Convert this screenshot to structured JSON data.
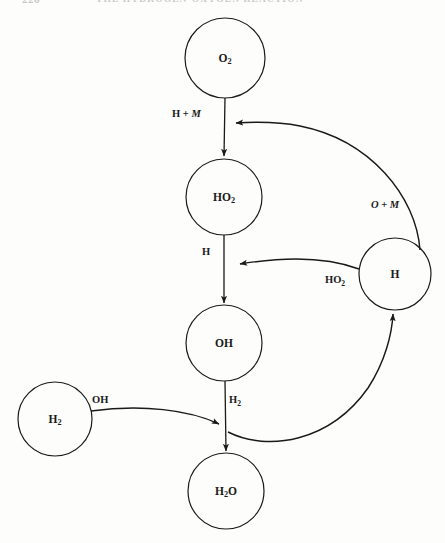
{
  "page": {
    "running_header": {
      "folio": "226",
      "title": "THE HYDROGEN-OXYGEN REACTION"
    },
    "background_color": "#fdfdfc",
    "ink_color": "#1a1a1a"
  },
  "diagram": {
    "type": "reaction-pathway-cycle",
    "nodes": [
      {
        "id": "o2",
        "label": "O",
        "sub": "2",
        "cx": 225,
        "cy": 58,
        "r": 40
      },
      {
        "id": "ho2",
        "label": "HO",
        "sub": "2",
        "cx": 224,
        "cy": 197,
        "r": 38
      },
      {
        "id": "oh",
        "label": "OH",
        "sub": "",
        "cx": 224,
        "cy": 343,
        "r": 38
      },
      {
        "id": "h2o",
        "label": "H",
        "sub": "2",
        "label2": "O",
        "cx": 226,
        "cy": 491,
        "r": 38
      },
      {
        "id": "h",
        "label": "H",
        "sub": "",
        "cx": 395,
        "cy": 274,
        "r": 36
      },
      {
        "id": "h2",
        "label": "H",
        "sub": "2",
        "cx": 55,
        "cy": 419,
        "r": 37
      }
    ],
    "edges": [
      {
        "id": "o2-ho2",
        "from": "o2",
        "to": "ho2",
        "label": "H + M",
        "label_italic_part": "M"
      },
      {
        "id": "ho2-oh",
        "from": "ho2",
        "to": "oh",
        "label": "H"
      },
      {
        "id": "oh-h2o",
        "from": "oh",
        "to": "h2o",
        "label": "H",
        "label_sub": "2"
      },
      {
        "id": "h-o2",
        "from": "h",
        "to": "o2-ho2-trunk",
        "label": "O + M",
        "label_italic_part": "O + M"
      },
      {
        "id": "h-ho2",
        "from": "h",
        "to": "ho2-oh-trunk",
        "label": "HO",
        "label_sub": "2"
      },
      {
        "id": "h2-h2o",
        "from": "h2",
        "to": "oh-h2o-trunk",
        "label": "OH"
      },
      {
        "id": "h2o-h",
        "from": "h2o-trunk",
        "to": "h",
        "label": ""
      }
    ],
    "edge_labels": [
      {
        "id": "lbl-h-plus-m",
        "text": "H + M",
        "x": 173,
        "y": 113
      },
      {
        "id": "lbl-h-a",
        "text": "H",
        "x": 206,
        "y": 251
      },
      {
        "id": "lbl-h2",
        "text": "H2",
        "x": 232,
        "y": 399
      },
      {
        "id": "lbl-o-plus-m",
        "text": "O + M",
        "x": 376,
        "y": 204
      },
      {
        "id": "lbl-ho2",
        "text": "HO2",
        "x": 334,
        "y": 279
      },
      {
        "id": "lbl-oh",
        "text": "OH",
        "x": 100,
        "y": 399
      }
    ]
  }
}
